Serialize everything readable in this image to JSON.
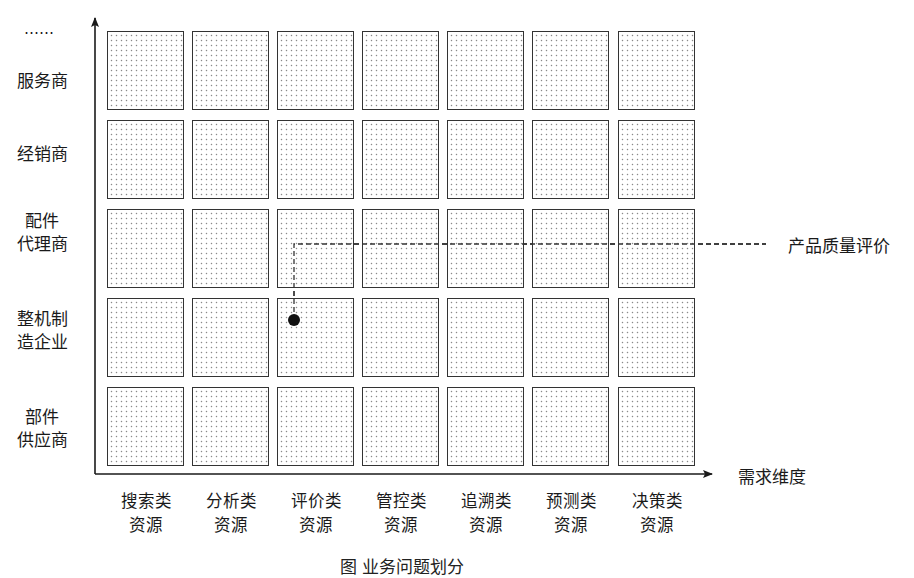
{
  "diagram": {
    "y_axis": {
      "title_ellipsis": "……",
      "rows": [
        {
          "lines": [
            "服务商"
          ]
        },
        {
          "lines": [
            "经销商"
          ]
        },
        {
          "lines": [
            "配件",
            "代理商"
          ]
        },
        {
          "lines": [
            "整机制",
            "造企业"
          ]
        },
        {
          "lines": [
            "部件",
            "供应商"
          ]
        }
      ]
    },
    "x_axis": {
      "title": "需求维度",
      "columns": [
        {
          "lines": [
            "搜索类",
            "资源"
          ]
        },
        {
          "lines": [
            "分析类",
            "资源"
          ]
        },
        {
          "lines": [
            "评价类",
            "资源"
          ]
        },
        {
          "lines": [
            "管控类",
            "资源"
          ]
        },
        {
          "lines": [
            "追溯类",
            "资源"
          ]
        },
        {
          "lines": [
            "预测类",
            "资源"
          ]
        },
        {
          "lines": [
            "决策类",
            "资源"
          ]
        }
      ]
    },
    "grid": {
      "rows": 5,
      "columns": 7,
      "fill_pattern": "dotted",
      "border_color": "#333333",
      "dot_color": "#8a8a8a"
    },
    "callout": {
      "label": "产品质量评价",
      "marker": "filled-dot",
      "row": "整机制造企业",
      "column": "评价类资源",
      "line_style": "dashed"
    },
    "caption": "图 业务问题划分"
  }
}
